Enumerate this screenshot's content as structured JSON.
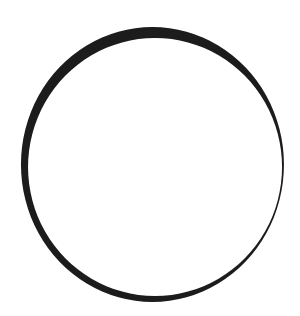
{
  "figure": {
    "shape": "ring",
    "colors": {
      "stroke": "#1c1c1c",
      "background": "#ffffff"
    }
  }
}
